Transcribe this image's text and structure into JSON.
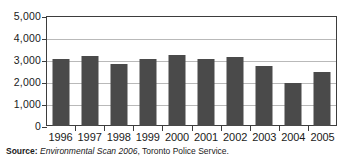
{
  "chart_data": {
    "type": "bar",
    "title": "",
    "subtitle": "",
    "xlabel": "",
    "ylabel": "",
    "categories": [
      "1996",
      "1997",
      "1998",
      "1999",
      "2000",
      "2001",
      "2002",
      "2003",
      "2004",
      "2005"
    ],
    "values": [
      3060,
      3180,
      2800,
      3050,
      3250,
      3030,
      3140,
      2710,
      1950,
      2450
    ],
    "series": [
      {
        "name": "",
        "values": [
          3060,
          3180,
          2800,
          3050,
          3250,
          3030,
          3140,
          2710,
          1950,
          2450
        ]
      }
    ],
    "ylim": [
      0,
      5000
    ],
    "ytick_values": [
      0,
      1000,
      2000,
      3000,
      4000,
      5000
    ],
    "ytick_labels": [
      "0",
      "1,000",
      "2,000",
      "3,000",
      "4,000",
      "5,000"
    ],
    "grid": true,
    "grid_axis": "y",
    "legend": false,
    "legend_position": "none",
    "bar_color": "#4a4a4a",
    "gridline_color": "#b9b9b9",
    "axis_color": "#3d3d3d",
    "background_color": "#ffffff"
  },
  "source": {
    "label": "Source:",
    "title": "Environmental Scan 2006",
    "publisher": ", Toronto Police Service."
  }
}
